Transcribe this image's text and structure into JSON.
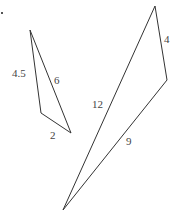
{
  "diagram": {
    "stroke_color": "#333333",
    "triangle_small": {
      "vertices": [
        [
          30,
          30
        ],
        [
          41,
          113
        ],
        [
          71,
          133
        ]
      ],
      "labels": [
        {
          "text": "4.5",
          "x": 12,
          "y": 68
        },
        {
          "text": "6",
          "x": 54,
          "y": 75
        },
        {
          "text": "2",
          "x": 50,
          "y": 130
        }
      ]
    },
    "triangle_large": {
      "vertices": [
        [
          155,
          6
        ],
        [
          167,
          80
        ],
        [
          63,
          210
        ]
      ],
      "labels": [
        {
          "text": "4",
          "x": 164,
          "y": 34
        },
        {
          "text": "12",
          "x": 92,
          "y": 99
        },
        {
          "text": "9",
          "x": 126,
          "y": 136
        }
      ]
    }
  }
}
